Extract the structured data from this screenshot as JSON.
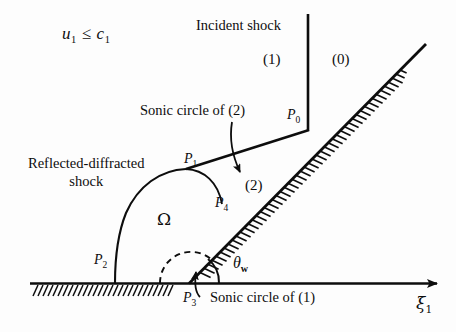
{
  "figure": {
    "name": "regular-reflection-shock-diagram",
    "condition": {
      "lhs": "u",
      "lhs_sub": "1",
      "operator": "≤",
      "rhs": "c",
      "rhs_sub": "1"
    },
    "labels": {
      "incident_shock": "Incident shock",
      "sonic_circle_2": "Sonic circle of (2)",
      "sonic_circle_1": "Sonic circle of (1)",
      "reflected_shock_line1": "Reflected-diffracted",
      "reflected_shock_line2": "shock",
      "region_0": "(0)",
      "region_1": "(1)",
      "region_2": "(2)",
      "omega": "Ω",
      "theta_w": "θ",
      "theta_w_sub": "w",
      "axis_xi": "ξ",
      "axis_xi_sub": "1"
    },
    "points": [
      {
        "id": "P0",
        "letter": "P",
        "sub": "0",
        "x": 287,
        "y": 108
      },
      {
        "id": "P1",
        "letter": "P",
        "sub": "1",
        "x": 184,
        "y": 152
      },
      {
        "id": "P2",
        "letter": "P",
        "sub": "2",
        "x": 94,
        "y": 253
      },
      {
        "id": "P3",
        "letter": "P",
        "sub": "3",
        "x": 183,
        "y": 291
      },
      {
        "id": "P4",
        "letter": "P",
        "sub": "4",
        "x": 215,
        "y": 196
      }
    ],
    "colors": {
      "ink": "#0d0d0d",
      "background": "#fdfdfd"
    }
  }
}
